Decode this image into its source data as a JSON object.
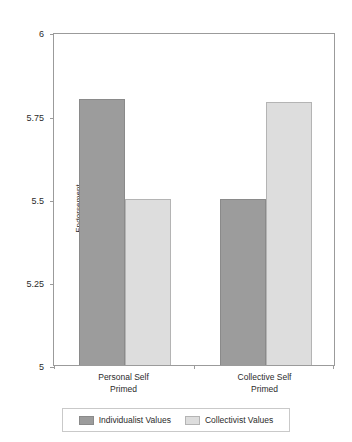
{
  "chart_data": {
    "type": "bar",
    "title": "",
    "subtitle": "",
    "xlabel": "",
    "ylabel": "Endorsement",
    "categories": [
      "Personal Self\nPrimed",
      "Collective Self\nPrimed"
    ],
    "category_lines": [
      [
        "Personal Self",
        "Primed"
      ],
      [
        "Collective Self",
        "Primed"
      ]
    ],
    "series": [
      {
        "name": "Individualist Values",
        "values": [
          5.8,
          5.5
        ],
        "color": "#9c9c9c"
      },
      {
        "name": "Collectivist Values",
        "values": [
          5.5,
          5.79
        ],
        "color": "#dddddd"
      }
    ],
    "ylim": [
      5,
      6
    ],
    "yticks": [
      6,
      5.75,
      5.5,
      5.25,
      5
    ],
    "ytick_labels": [
      "6",
      "5.75",
      "5.5",
      "5.25",
      "5"
    ],
    "grid": false,
    "legend_position": "bottom",
    "axis_color": "#9b9b9b",
    "background": "#ffffff"
  }
}
